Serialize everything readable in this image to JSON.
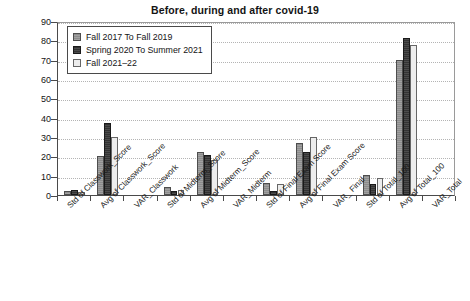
{
  "chart_data": {
    "type": "bar",
    "title": "Before, during and after covid-19",
    "xlabel": "",
    "ylabel": "",
    "ylim": [
      0,
      90
    ],
    "ytick_step": 10,
    "yticks": [
      0,
      10,
      20,
      30,
      40,
      50,
      60,
      70,
      80,
      90
    ],
    "grid": true,
    "legend_position": "upper-left-inside",
    "categories": [
      "Std of Classwork_Score",
      "Avg of Classwork_Score",
      "VAR_Classwork",
      "Std of Midterm_Score",
      "Avg of Midterm_Score",
      "VAR_Midterm",
      "Std of Final Exam Score",
      "Avg of Final Exam Score",
      "VAR_ Final",
      "Std of Total_100",
      "Avg of Total_100",
      "VAR_Total"
    ],
    "series": [
      {
        "name": "Fall 2017 To Fall 2019",
        "color": "#8c8c8c",
        "values": [
          2,
          20,
          0,
          4,
          22,
          0,
          6,
          27,
          0,
          10.5,
          70,
          0
        ]
      },
      {
        "name": "Spring 2020 To Summer 2021",
        "color": "#333333",
        "values": [
          2.5,
          37,
          0,
          2,
          20.5,
          0,
          2,
          22.5,
          0,
          5.5,
          81,
          0
        ]
      },
      {
        "name": "Fall 2021–22",
        "color": "#ededed",
        "values": [
          1.5,
          30,
          0,
          2.5,
          18,
          0,
          5.5,
          30,
          0,
          9,
          77.5,
          0
        ]
      }
    ]
  },
  "legend": {
    "items": [
      {
        "label": "Fall 2017 To Fall 2019"
      },
      {
        "label": "Spring 2020 To Summer 2021"
      },
      {
        "label": "Fall 2021–22"
      }
    ]
  }
}
